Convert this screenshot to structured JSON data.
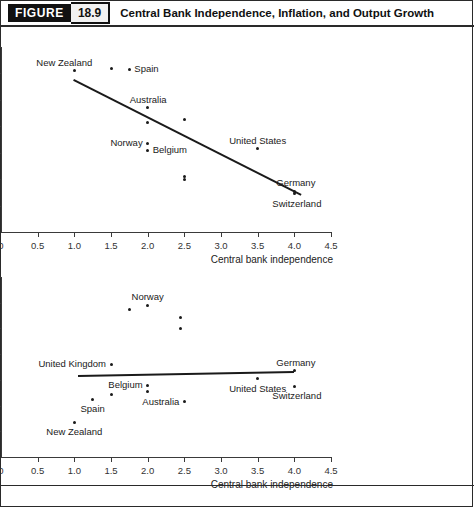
{
  "header": {
    "tag": "FIGURE",
    "number": "18.9",
    "title": "Central Bank Independence, Inflation, and Output Growth"
  },
  "colors": {
    "ink": "#1a1a1a",
    "axis": "#3a3a3a",
    "tag_bg": "#111111",
    "num_bg": "#f2f2f2",
    "background": "#ffffff"
  },
  "chart_data": [
    {
      "id": "inflation",
      "type": "scatter",
      "title": "",
      "xlabel": "Central bank independence",
      "ylabel": "Average rate of inflation (percent)",
      "ylabel_lines": [
        "Average rate",
        "of inflation",
        "(percent)"
      ],
      "xlim": [
        0,
        4.5
      ],
      "ylim": [
        0,
        14
      ],
      "grid": false,
      "legend": "none",
      "xticks": [
        "0",
        "0.5",
        "1.0",
        "1.5",
        "2.0",
        "2.5",
        "3.0",
        "3.5",
        "4.0",
        "4.5"
      ],
      "xtick_values": [
        0,
        0.5,
        1.0,
        1.5,
        2.0,
        2.5,
        3.0,
        3.5,
        4.0,
        4.5
      ],
      "yticks": [
        "0",
        "2",
        "4",
        "6",
        "8",
        "10",
        "12",
        "14%"
      ],
      "ytick_values": [
        0,
        2,
        4,
        6,
        8,
        10,
        12,
        14
      ],
      "points": [
        {
          "label": "New Zealand",
          "x": 1.0,
          "y": 12.2,
          "label_pos": "above-left"
        },
        {
          "label": "",
          "x": 1.5,
          "y": 12.4,
          "label_pos": "none"
        },
        {
          "label": "Spain",
          "x": 1.75,
          "y": 12.3,
          "label_pos": "right"
        },
        {
          "label": "Australia",
          "x": 2.0,
          "y": 9.4,
          "label_pos": "above-right"
        },
        {
          "label": "",
          "x": 2.0,
          "y": 8.3,
          "label_pos": "none"
        },
        {
          "label": "",
          "x": 2.5,
          "y": 8.5,
          "label_pos": "none"
        },
        {
          "label": "Norway",
          "x": 2.0,
          "y": 6.7,
          "label_pos": "left"
        },
        {
          "label": "Belgium",
          "x": 2.0,
          "y": 6.2,
          "label_pos": "right"
        },
        {
          "label": "",
          "x": 2.5,
          "y": 4.2,
          "label_pos": "none"
        },
        {
          "label": "",
          "x": 2.5,
          "y": 4.0,
          "label_pos": "none"
        },
        {
          "label": "United States",
          "x": 3.5,
          "y": 6.3,
          "label_pos": "above"
        },
        {
          "label": "Germany",
          "x": 4.0,
          "y": 3.1,
          "label_pos": "above-right"
        },
        {
          "label": "Switzerland",
          "x": 4.0,
          "y": 2.9,
          "label_pos": "below-right"
        }
      ],
      "trendline": {
        "x1": 1.0,
        "y1": 11.6,
        "x2": 4.1,
        "y2": 2.9
      }
    },
    {
      "id": "growth",
      "type": "scatter",
      "title": "",
      "xlabel": "Central bank independence",
      "ylabel": "Average rate of real GDP per capita growth (percent)",
      "ylabel_lines": [
        "Average rate",
        "of real GDP per",
        "capita growth",
        "(percent)"
      ],
      "xlim": [
        0,
        4.5
      ],
      "ylim": [
        0,
        3.5
      ],
      "grid": false,
      "legend": "none",
      "xticks": [
        "0",
        "0.5",
        "1.0",
        "1.5",
        "2.0",
        "2.5",
        "3.0",
        "3.5",
        "4.0",
        "4.5"
      ],
      "xtick_values": [
        0,
        0.5,
        1.0,
        1.5,
        2.0,
        2.5,
        3.0,
        3.5,
        4.0,
        4.5
      ],
      "yticks": [
        "0",
        "0.5",
        "1.0",
        "1.5",
        "2.0",
        "2.5",
        "3.0",
        "3.5%"
      ],
      "ytick_values": [
        0,
        0.5,
        1.0,
        1.5,
        2.0,
        2.5,
        3.0,
        3.5
      ],
      "points": [
        {
          "label": "",
          "x": 1.75,
          "y": 2.87,
          "label_pos": "none"
        },
        {
          "label": "Norway",
          "x": 2.0,
          "y": 2.95,
          "label_pos": "above"
        },
        {
          "label": "",
          "x": 2.45,
          "y": 2.72,
          "label_pos": "none"
        },
        {
          "label": "",
          "x": 2.45,
          "y": 2.5,
          "label_pos": "none"
        },
        {
          "label": "United Kingdom",
          "x": 1.5,
          "y": 1.8,
          "label_pos": "left"
        },
        {
          "label": "Germany",
          "x": 4.0,
          "y": 1.68,
          "label_pos": "above-right"
        },
        {
          "label": "Belgium",
          "x": 2.0,
          "y": 1.4,
          "label_pos": "left"
        },
        {
          "label": "",
          "x": 2.0,
          "y": 1.28,
          "label_pos": "none"
        },
        {
          "label": "United States",
          "x": 3.5,
          "y": 1.52,
          "label_pos": "below"
        },
        {
          "label": "Switzerland",
          "x": 4.0,
          "y": 1.38,
          "label_pos": "below-right"
        },
        {
          "label": "Australia",
          "x": 2.5,
          "y": 1.07,
          "label_pos": "left"
        },
        {
          "label": "",
          "x": 1.5,
          "y": 1.22,
          "label_pos": "none"
        },
        {
          "label": "Spain",
          "x": 1.25,
          "y": 1.12,
          "label_pos": "below"
        },
        {
          "label": "New Zealand",
          "x": 1.0,
          "y": 0.68,
          "label_pos": "below"
        }
      ],
      "trendline": {
        "x1": 1.05,
        "y1": 1.6,
        "x2": 4.0,
        "y2": 1.68
      }
    }
  ]
}
